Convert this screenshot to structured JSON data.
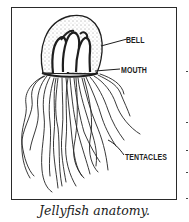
{
  "figure": {
    "labels": {
      "bell": "BELL",
      "mouth": "MOUTH",
      "tentacles": "TENTACLES"
    },
    "caption": "Jellyfish anatomy."
  }
}
